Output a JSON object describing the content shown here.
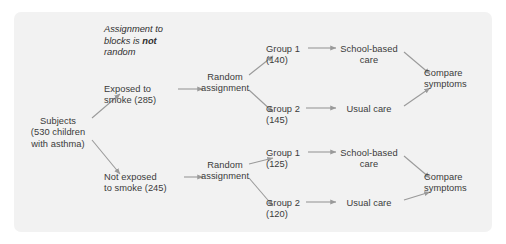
{
  "figure": {
    "kind": "flowchart",
    "background_color": "#ffffff",
    "panel_color": "#f2f2f2",
    "text_color": "#3a3a3a",
    "arrow_color": "#9a9a9a"
  },
  "annotation": {
    "line1": "Assignment to",
    "line2_prefix": "blocks is ",
    "line2_emphasis": "not",
    "line3": "random"
  },
  "nodes": {
    "subjects": "Subjects\n(530 children\nwith asthma)",
    "exposed": "Exposed to\nsmoke (285)",
    "not_exposed": "Not exposed\nto smoke (245)",
    "random_assignment_top": "Random\nassignment",
    "random_assignment_bottom": "Random\nassignment",
    "group1_top": "Group 1\n(140)",
    "group2_top": "Group 2\n(145)",
    "group1_bottom": "Group 1\n(125)",
    "group2_bottom": "Group 2\n(120)",
    "treatment_school_top": "School-based\ncare",
    "treatment_usual_top": "Usual care",
    "treatment_school_bottom": "School-based\ncare",
    "treatment_usual_bottom": "Usual care",
    "compare_top": "Compare\nsymptoms",
    "compare_bottom": "Compare\nsymptoms"
  }
}
